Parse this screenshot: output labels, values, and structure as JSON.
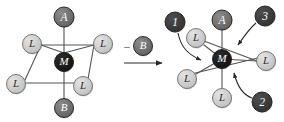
{
  "diagram": {
    "type": "chemical-reaction-scheme",
    "canvas": {
      "width": 284,
      "height": 122,
      "background": "#ffffff"
    },
    "colors": {
      "dark_node_fill": "#3b3b3b",
      "dark_node_stroke": "#1d1d1d",
      "darkest_node_fill": "#171717",
      "mid_node_fill": "#6e6e6e",
      "light_node_fill": "#c9c9c9",
      "light_node_stroke": "#6b6b6b",
      "bond_stroke": "#555555",
      "arrow_stroke": "#2a2a2a",
      "label_light": "#2a2a2a",
      "label_dark": "#ffffff"
    },
    "reactant": {
      "name": "octahedral-complex",
      "center": {
        "label": "M",
        "x": 64,
        "y": 62,
        "r": 9.5,
        "tone": "darkest"
      },
      "axial": [
        {
          "label": "A",
          "x": 64,
          "y": 17,
          "r": 10,
          "tone": "mid"
        },
        {
          "label": "B",
          "x": 64,
          "y": 108,
          "r": 9.5,
          "tone": "mid"
        }
      ],
      "equatorial": [
        {
          "label": "L",
          "x": 32,
          "y": 44,
          "r": 9.5,
          "tone": "light"
        },
        {
          "label": "L",
          "x": 103,
          "y": 44,
          "r": 9.5,
          "tone": "light"
        },
        {
          "label": "L",
          "x": 16,
          "y": 84,
          "r": 9.5,
          "tone": "light"
        },
        {
          "label": "L",
          "x": 83,
          "y": 86,
          "r": 9.5,
          "tone": "light"
        }
      ]
    },
    "reaction_arrow": {
      "name": "reaction-arrow",
      "condition_sign": "–",
      "condition_label": "B",
      "condition_node": {
        "x": 143,
        "y": 46,
        "r": 9.5,
        "tone": "mid"
      },
      "sign_x": 127,
      "sign_y": 46,
      "shaft": {
        "x1": 124,
        "y1": 63,
        "x2": 162,
        "y2": 63
      }
    },
    "product": {
      "name": "five-coordinate-intermediate",
      "center": {
        "label": "M",
        "x": 222,
        "y": 59,
        "r": 9.5,
        "tone": "darkest"
      },
      "axial": [
        {
          "label": "A",
          "x": 222,
          "y": 20,
          "r": 10,
          "tone": "mid"
        },
        {
          "label": "L",
          "x": 222,
          "y": 98,
          "r": 9.5,
          "tone": "light"
        }
      ],
      "equatorial": [
        {
          "label": "L",
          "x": 196,
          "y": 38,
          "r": 9.5,
          "tone": "light"
        },
        {
          "label": "L",
          "x": 266,
          "y": 61,
          "r": 9.5,
          "tone": "light"
        },
        {
          "label": "L",
          "x": 187,
          "y": 79,
          "r": 9.5,
          "tone": "light"
        }
      ]
    },
    "attack_vectors": [
      {
        "label": "1",
        "name": "attack-vector-1",
        "node": {
          "x": 175,
          "y": 22,
          "r": 10,
          "tone": "dark"
        },
        "path": "M 178,33 C 181,48 189,55 201,60",
        "tip": {
          "x": 201,
          "y": 60
        }
      },
      {
        "label": "2",
        "name": "attack-vector-2",
        "node": {
          "x": 262,
          "y": 102,
          "r": 10,
          "tone": "dark"
        },
        "path": "M 252,98 C 243,95 237,85 234,73",
        "tip": {
          "x": 234,
          "y": 73
        }
      },
      {
        "label": "3",
        "name": "attack-vector-3",
        "node": {
          "x": 265,
          "y": 16,
          "r": 10,
          "tone": "dark"
        },
        "path": "M 256,23 C 248,30 243,38 238,45",
        "tip": {
          "x": 238,
          "y": 45
        }
      }
    ],
    "reactant_bonds": [
      {
        "x1": 64,
        "y1": 62,
        "x2": 64,
        "y2": 26
      },
      {
        "x1": 64,
        "y1": 62,
        "x2": 64,
        "y2": 99
      },
      {
        "x1": 64,
        "y1": 53,
        "x2": 41,
        "y2": 45
      },
      {
        "x1": 64,
        "y1": 53,
        "x2": 94,
        "y2": 45
      },
      {
        "x1": 41,
        "y1": 45,
        "x2": 25,
        "y2": 80
      },
      {
        "x1": 94,
        "y1": 45,
        "x2": 88,
        "y2": 79
      },
      {
        "x1": 25,
        "y1": 83,
        "x2": 75,
        "y2": 83
      },
      {
        "x1": 41,
        "y1": 45,
        "x2": 94,
        "y2": 45
      }
    ],
    "product_bonds": [
      {
        "x1": 222,
        "y1": 59,
        "x2": 222,
        "y2": 30
      },
      {
        "x1": 222,
        "y1": 59,
        "x2": 222,
        "y2": 89
      },
      {
        "x1": 222,
        "y1": 59,
        "x2": 204,
        "y2": 45
      },
      {
        "x1": 222,
        "y1": 59,
        "x2": 257,
        "y2": 61
      },
      {
        "x1": 222,
        "y1": 59,
        "x2": 196,
        "y2": 74
      },
      {
        "x1": 196,
        "y1": 38,
        "x2": 257,
        "y2": 61
      },
      {
        "x1": 187,
        "y1": 75,
        "x2": 262,
        "y2": 57
      }
    ]
  }
}
